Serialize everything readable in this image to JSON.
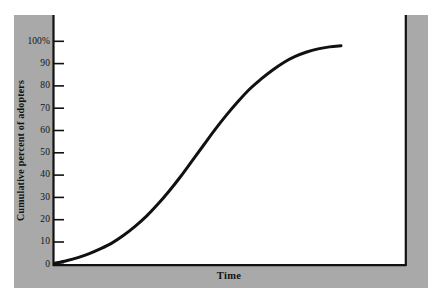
{
  "figure": {
    "background_color": "#ffffff",
    "panel_color": "#a9a9a9",
    "plot_background_color": "#ffffff",
    "axis_color": "#111111",
    "curve_color": "#111111"
  },
  "chart_data": {
    "type": "line",
    "title": "",
    "subtitle": "",
    "xlabel": "Time",
    "ylabel": "Cumulative percent of adopters",
    "grid": false,
    "legend": null,
    "legend_position": "none",
    "xlim": [
      0,
      100
    ],
    "ylim": [
      0,
      100
    ],
    "x_tick_labels": [],
    "y_ticks": [
      0,
      10,
      20,
      30,
      40,
      50,
      60,
      70,
      80,
      90,
      100
    ],
    "y_tick_labels": [
      "0",
      "10",
      "20",
      "30",
      "40",
      "50",
      "60",
      "70",
      "80",
      "90",
      "100%"
    ],
    "annotations": [],
    "series": [
      {
        "name": "Cumulative adopters",
        "shape": "logistic S-curve",
        "color": "#111111",
        "line_width": 3,
        "x": [
          0,
          4,
          8,
          12,
          16,
          20,
          24,
          28,
          32,
          36,
          40,
          44,
          48,
          52,
          56,
          60,
          64,
          68,
          72,
          76,
          80,
          84,
          88,
          92,
          96,
          100
        ],
        "values": [
          0.5,
          1.6,
          3.0,
          4.8,
          7.0,
          9.6,
          13.0,
          17.0,
          21.6,
          27.0,
          33.0,
          39.5,
          46.5,
          53.5,
          60.5,
          67.0,
          73.0,
          78.5,
          83.0,
          87.0,
          90.5,
          93.2,
          95.2,
          96.6,
          97.5,
          98.0
        ]
      }
    ]
  },
  "axis": {
    "y_title": "Cumulative percent of adopters",
    "x_title": "Time",
    "tick_labels": [
      "100%",
      "90",
      "80",
      "70",
      "60",
      "50",
      "40",
      "30",
      "20",
      "10",
      "0"
    ]
  }
}
